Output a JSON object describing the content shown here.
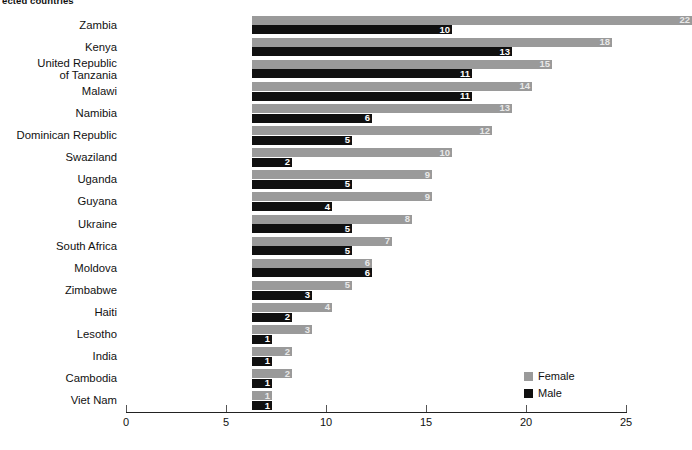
{
  "chart_data": {
    "type": "bar",
    "orientation": "horizontal",
    "title": "ected countries",
    "xlabel": "",
    "ylabel": "",
    "xlim": [
      0,
      25
    ],
    "xticks": [
      0,
      5,
      10,
      15,
      20,
      25
    ],
    "grid": false,
    "legend_position": "bottom-right",
    "categories": [
      "Zambia",
      "Kenya",
      "United Republic\nof Tanzania",
      "Malawi",
      "Namibia",
      "Dominican Republic",
      "Swaziland",
      "Uganda",
      "Guyana",
      "Ukraine",
      "South Africa",
      "Moldova",
      "Zimbabwe",
      "Haiti",
      "Lesotho",
      "India",
      "Cambodia",
      "Viet Nam"
    ],
    "series": [
      {
        "name": "Female",
        "color": "#9a9a9a",
        "values": [
          22,
          18,
          15,
          14,
          13,
          12,
          10,
          9,
          9,
          8,
          7,
          6,
          5,
          4,
          3,
          2,
          2,
          1
        ]
      },
      {
        "name": "Male",
        "color": "#101010",
        "values": [
          10,
          13,
          11,
          11,
          6,
          5,
          2,
          5,
          4,
          5,
          5,
          6,
          3,
          2,
          1,
          1,
          1,
          1
        ]
      }
    ]
  },
  "legend": {
    "items": [
      {
        "label": "Female",
        "color": "#9a9a9a"
      },
      {
        "label": "Male",
        "color": "#101010"
      }
    ]
  }
}
